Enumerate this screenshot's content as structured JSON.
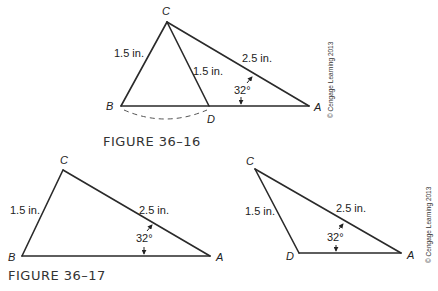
{
  "figures": [
    {
      "caption": "Figure 36–16",
      "caption_display": "FIGURE 36–16",
      "vertices": {
        "C": "C",
        "B": "B",
        "D": "D",
        "A": "A"
      },
      "labels": {
        "BC": "1.5 in.",
        "CD": "1.5 in.",
        "CA": "2.5 in.",
        "angle_A": "32°"
      },
      "copyright": "© Cengage Learning 2013",
      "note": "dashed arc between B and D"
    },
    {
      "caption": "Figure 36–17",
      "caption_display": "FIGURE 36–17",
      "left_triangle": {
        "vertices": {
          "C": "C",
          "B": "B",
          "A": "A"
        },
        "labels": {
          "BC": "1.5 in.",
          "CA": "2.5 in.",
          "angle_A": "32°"
        }
      },
      "right_triangle": {
        "vertices": {
          "C": "C",
          "D": "D",
          "A": "A"
        },
        "labels": {
          "DC": "1.5 in.",
          "CA": "2.5 in.",
          "angle_A": "32°"
        }
      },
      "copyright": "© Cengage Learning 2013"
    }
  ]
}
